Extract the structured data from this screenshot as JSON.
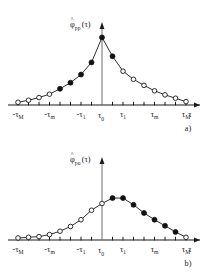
{
  "figure": {
    "panels": [
      {
        "tag": "a)",
        "ylabel": {
          "symbol": "φ",
          "hat": "˄",
          "subscript": "pp",
          "argument": "(τ)",
          "full": "φ̂pp(τ)"
        },
        "xlabel": "τ",
        "xticklabels": [
          {
            "text": "-τ",
            "sub": "M"
          },
          {
            "text": "-τ",
            "sub": "m"
          },
          {
            "text": "-τ",
            "sub": "1"
          },
          {
            "text": "τ",
            "sub": "0"
          },
          {
            "text": "τ",
            "sub": "1"
          },
          {
            "text": "τ",
            "sub": "m"
          },
          {
            "text": "τ",
            "sub": "M"
          }
        ]
      },
      {
        "tag": "b)",
        "ylabel": {
          "symbol": "φ",
          "hat": "˄",
          "subscript": "pu",
          "argument": "(τ)",
          "full": "φ̂pu(τ)"
        },
        "xlabel": "τ",
        "xticklabels": [
          {
            "text": "-τ",
            "sub": "M"
          },
          {
            "text": "-τ",
            "sub": "m"
          },
          {
            "text": "-τ",
            "sub": "1"
          },
          {
            "text": "τ",
            "sub": "0"
          },
          {
            "text": "τ",
            "sub": "1"
          },
          {
            "text": "τ",
            "sub": "m"
          },
          {
            "text": "τ",
            "sub": "M"
          }
        ]
      }
    ],
    "colors": {
      "ink": "#1a1a1a",
      "vaxis": "#6d6d6d",
      "marker_fill": "#111111",
      "marker_open": "#ffffff",
      "background": "#ffffff"
    }
  },
  "chart_data": [
    {
      "type": "line",
      "id": "panel-a",
      "title": "φ̂pp(τ)",
      "xlabel": "τ",
      "ylabel": "φ̂pp(τ)",
      "grid": false,
      "legend": null,
      "xlim": [
        -8,
        8
      ],
      "ylim": [
        0,
        1.05
      ],
      "xtick_positions": [
        -8,
        -5,
        -2,
        0,
        2,
        5,
        8
      ],
      "xtick_labels": [
        "-τM",
        "-τm",
        "-τ1",
        "τ0",
        "τ1",
        "τm",
        "τM"
      ],
      "x": [
        -8,
        -7,
        -6,
        -5,
        -4,
        -3,
        -2,
        -1,
        0,
        1,
        2,
        3,
        4,
        5,
        6,
        7,
        8
      ],
      "y": [
        0.04,
        0.07,
        0.11,
        0.16,
        0.24,
        0.33,
        0.45,
        0.63,
        1.0,
        0.72,
        0.5,
        0.38,
        0.29,
        0.21,
        0.15,
        0.1,
        0.05
      ],
      "marker_styles": [
        "open",
        "open",
        "open",
        "open",
        "filled",
        "filled",
        "filled",
        "filled",
        "filled",
        "filled",
        "open",
        "open",
        "open",
        "open",
        "open",
        "open",
        "open"
      ],
      "description": "Symmetric autocorrelation peak at τ0"
    },
    {
      "type": "line",
      "id": "panel-b",
      "title": "φ̂pu(τ)",
      "xlabel": "τ",
      "ylabel": "φ̂pu(τ)",
      "grid": false,
      "legend": null,
      "xlim": [
        -8,
        8
      ],
      "ylim": [
        0,
        1.05
      ],
      "xtick_positions": [
        -8,
        -5,
        -2,
        0,
        2,
        5,
        8
      ],
      "xtick_labels": [
        "-τM",
        "-τm",
        "-τ1",
        "τ0",
        "τ1",
        "τm",
        "τM"
      ],
      "x": [
        -8,
        -7,
        -6,
        -5,
        -4,
        -3,
        -2,
        -1,
        0,
        1,
        2,
        3,
        4,
        5,
        6,
        7,
        8
      ],
      "y": [
        0.03,
        0.04,
        0.05,
        0.08,
        0.13,
        0.2,
        0.3,
        0.44,
        0.54,
        0.62,
        0.62,
        0.52,
        0.4,
        0.3,
        0.21,
        0.12,
        0.04
      ],
      "marker_styles": [
        "open",
        "open",
        "open",
        "open",
        "open",
        "open",
        "open",
        "open",
        "open",
        "filled",
        "filled",
        "filled",
        "filled",
        "filled",
        "filled",
        "filled",
        "open"
      ],
      "description": "Asymmetric cross-correlation peaked near τ1"
    }
  ]
}
